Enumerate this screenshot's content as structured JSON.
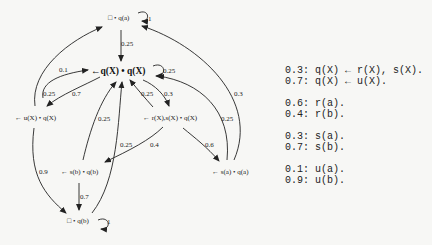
{
  "tree": {
    "nodes": {
      "root_success": "□ • q(a)",
      "main": "←q(X) • q(X)",
      "u_node": "← u(X) • q(X)",
      "rs_node": "← r(X),s(X) • q(X)",
      "sb_node": "← s(b) • q(b)",
      "sa_node": "← s(a) • q(a)",
      "bottom_success": "□ • q(b)"
    },
    "edges": {
      "root_self": "1",
      "root_to_main": "0.25",
      "main_self": "0.25",
      "u_to_root": "0.1",
      "u_to_main": "0.25",
      "main_to_u": "0.7",
      "main_to_rs": "0.3",
      "rs_to_main": "0.25",
      "sb_to_main": "0.25",
      "bottom_to_main": "0.25",
      "sa_to_main": "0.25",
      "sa_to_root": "0.3",
      "rs_to_sb": "0.4",
      "rs_to_sa": "0.6",
      "u_to_bottom": "0.9",
      "sb_to_bottom": "0.7",
      "bottom_self": "1"
    }
  },
  "program": {
    "groups": [
      {
        "lines": [
          "0.3: q(X) ← r(X), s(X).",
          "0.7: q(X) ← u(X)."
        ]
      },
      {
        "lines": [
          "0.6: r(a).",
          "0.4: r(b)."
        ]
      },
      {
        "lines": [
          "0.3: s(a).",
          "0.7: s(b)."
        ]
      },
      {
        "lines": [
          "0.1: u(a).",
          "0.9: u(b)."
        ]
      }
    ]
  }
}
